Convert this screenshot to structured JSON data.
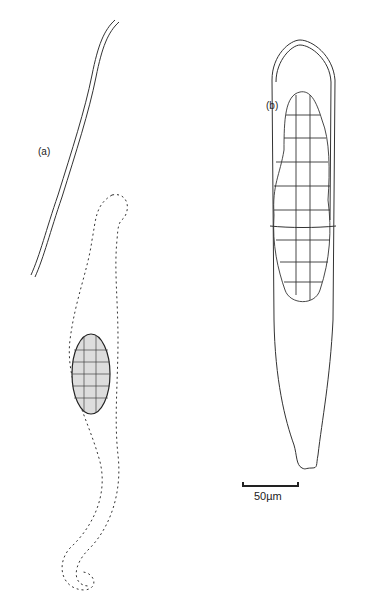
{
  "figure": {
    "panels": [
      {
        "id": "a",
        "label": "(a)",
        "description": "filament with dotted outline of spiral cell containing central granular mass"
      },
      {
        "id": "b",
        "label": "(b)",
        "description": "elongated sac containing cellular mass, tapering base"
      }
    ],
    "scale_bar": {
      "label": "50µm",
      "length_um": 50
    }
  }
}
